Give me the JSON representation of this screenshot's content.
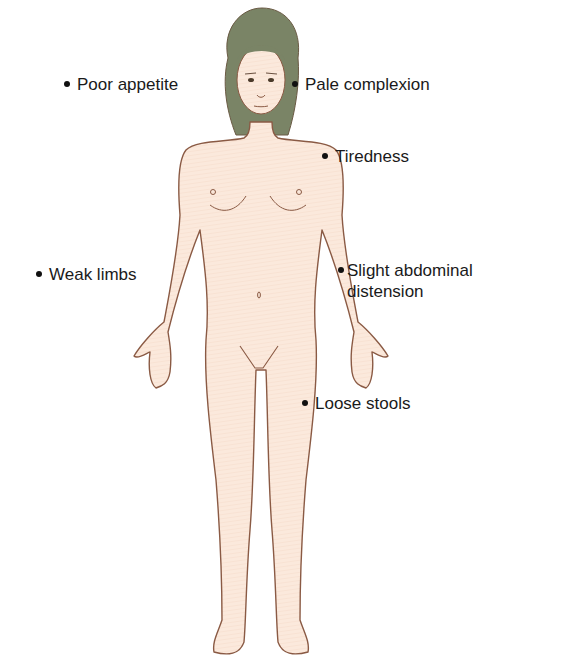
{
  "figure": {
    "colors": {
      "skin": "#fbe9dc",
      "outline": "#8a5a44",
      "hair": "#7a8466",
      "text": "#1a1a1a"
    }
  },
  "labels": [
    {
      "id": "poor-appetite",
      "text": "Poor appetite"
    },
    {
      "id": "pale-complexion",
      "text": "Pale complexion"
    },
    {
      "id": "tiredness",
      "text": "Tiredness"
    },
    {
      "id": "weak-limbs",
      "text": "Weak limbs"
    },
    {
      "id": "slight-abdominal-distension",
      "text": "Slight abdominal\ndistension"
    },
    {
      "id": "loose-stools",
      "text": "Loose stools"
    }
  ]
}
